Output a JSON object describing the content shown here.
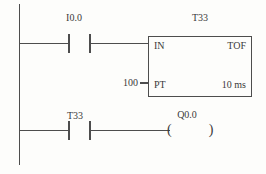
{
  "diagram": {
    "kind": "plc-ladder-diagram",
    "rung1": {
      "contact_label": "I0.0",
      "timer": {
        "title": "T33",
        "in_label": "IN",
        "type_label": "TOF",
        "pt_label": "PT",
        "pt_value": "100",
        "time_base": "10 ms"
      }
    },
    "rung2": {
      "contact_label": "T33",
      "coil_label": "Q0.0",
      "coil_symbol": "(  )"
    },
    "colors": {
      "line": "#4d4d4d",
      "text": "#3a3a3a",
      "background": "#fdfdfb"
    }
  }
}
